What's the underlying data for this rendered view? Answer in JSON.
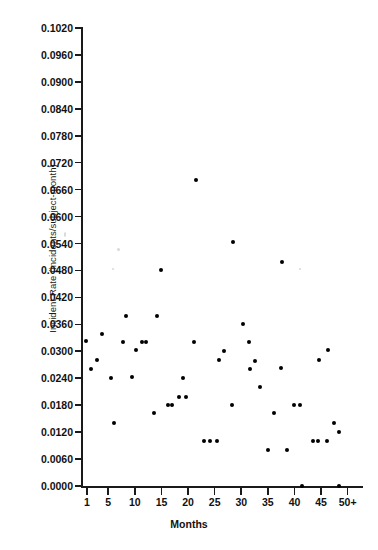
{
  "chart_data": {
    "type": "scatter",
    "title": "",
    "xlabel": "Months",
    "ylabel": "Incident Rate (incidents/subject-month)",
    "xlim": [
      0,
      53
    ],
    "ylim": [
      0.0,
      0.102
    ],
    "grid": false,
    "legend": "none",
    "marker": "filled-circle",
    "marker_color": "#000000",
    "xticks": [
      {
        "value": 1,
        "label": "1"
      },
      {
        "value": 5,
        "label": "5"
      },
      {
        "value": 10,
        "label": "10"
      },
      {
        "value": 15,
        "label": "15"
      },
      {
        "value": 20,
        "label": "20"
      },
      {
        "value": 25,
        "label": "25"
      },
      {
        "value": 30,
        "label": "30"
      },
      {
        "value": 35,
        "label": "35"
      },
      {
        "value": 40,
        "label": "40"
      },
      {
        "value": 45,
        "label": "45"
      },
      {
        "value": 50,
        "label": "50+"
      }
    ],
    "yticks": [
      {
        "value": 0.102,
        "label": "0.1020"
      },
      {
        "value": 0.096,
        "label": "0.0960"
      },
      {
        "value": 0.09,
        "label": "0.0900"
      },
      {
        "value": 0.084,
        "label": "0.0840"
      },
      {
        "value": 0.078,
        "label": "0.0780"
      },
      {
        "value": 0.072,
        "label": "0.0720"
      },
      {
        "value": 0.066,
        "label": "0.0660"
      },
      {
        "value": 0.06,
        "label": "0.0600"
      },
      {
        "value": 0.054,
        "label": "0.0540"
      },
      {
        "value": 0.048,
        "label": "0.0480"
      },
      {
        "value": 0.042,
        "label": "0.0420"
      },
      {
        "value": 0.036,
        "label": "0.0360"
      },
      {
        "value": 0.03,
        "label": "0.0300"
      },
      {
        "value": 0.024,
        "label": "0.0240"
      },
      {
        "value": 0.018,
        "label": "0.0180"
      },
      {
        "value": 0.012,
        "label": "0.0120"
      },
      {
        "value": 0.006,
        "label": "0.0060"
      },
      {
        "value": 0.0,
        "label": "0.0000"
      }
    ],
    "points": [
      {
        "x": 0.9,
        "y": 0.0323
      },
      {
        "x": 1.7,
        "y": 0.0261
      },
      {
        "x": 2.8,
        "y": 0.028
      },
      {
        "x": 3.8,
        "y": 0.0339
      },
      {
        "x": 5.5,
        "y": 0.024
      },
      {
        "x": 6.1,
        "y": 0.0141
      },
      {
        "x": 7.7,
        "y": 0.0321
      },
      {
        "x": 8.3,
        "y": 0.0379
      },
      {
        "x": 9.4,
        "y": 0.0242
      },
      {
        "x": 10.2,
        "y": 0.0302
      },
      {
        "x": 11.4,
        "y": 0.032
      },
      {
        "x": 12.1,
        "y": 0.032
      },
      {
        "x": 13.6,
        "y": 0.0162
      },
      {
        "x": 14.2,
        "y": 0.0379
      },
      {
        "x": 15.0,
        "y": 0.048
      },
      {
        "x": 16.2,
        "y": 0.018
      },
      {
        "x": 17.0,
        "y": 0.018
      },
      {
        "x": 18.2,
        "y": 0.0199
      },
      {
        "x": 19.0,
        "y": 0.0241
      },
      {
        "x": 19.7,
        "y": 0.0199
      },
      {
        "x": 21.2,
        "y": 0.0321
      },
      {
        "x": 21.4,
        "y": 0.0682
      },
      {
        "x": 23.0,
        "y": 0.0101
      },
      {
        "x": 24.2,
        "y": 0.0101
      },
      {
        "x": 25.4,
        "y": 0.0101
      },
      {
        "x": 25.8,
        "y": 0.028
      },
      {
        "x": 26.8,
        "y": 0.0301
      },
      {
        "x": 28.3,
        "y": 0.018
      },
      {
        "x": 28.4,
        "y": 0.0543
      },
      {
        "x": 30.3,
        "y": 0.036
      },
      {
        "x": 31.5,
        "y": 0.0321
      },
      {
        "x": 31.6,
        "y": 0.0261
      },
      {
        "x": 32.6,
        "y": 0.0279
      },
      {
        "x": 33.6,
        "y": 0.022
      },
      {
        "x": 35.0,
        "y": 0.008
      },
      {
        "x": 36.1,
        "y": 0.0162
      },
      {
        "x": 37.5,
        "y": 0.0262
      },
      {
        "x": 37.6,
        "y": 0.0499
      },
      {
        "x": 38.6,
        "y": 0.008
      },
      {
        "x": 40.0,
        "y": 0.018
      },
      {
        "x": 41.0,
        "y": 0.018
      },
      {
        "x": 41.5,
        "y": 0.0
      },
      {
        "x": 43.4,
        "y": 0.0101
      },
      {
        "x": 44.5,
        "y": 0.0101
      },
      {
        "x": 44.6,
        "y": 0.028
      },
      {
        "x": 46.1,
        "y": 0.0101
      },
      {
        "x": 46.3,
        "y": 0.0302
      },
      {
        "x": 47.5,
        "y": 0.0141
      },
      {
        "x": 48.3,
        "y": 0.0121
      },
      {
        "x": 48.4,
        "y": 0.0
      }
    ]
  }
}
